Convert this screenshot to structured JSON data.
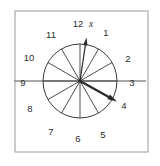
{
  "figure": {
    "frame": {
      "x": 15,
      "y": 11,
      "width": 133,
      "height": 141,
      "stroke": "#9a9a9a"
    },
    "clock": {
      "center_x": 80,
      "center_y": 81,
      "radius": 37,
      "stroke": "#3a3a3a",
      "hub_radius": 1.8
    },
    "hour_labels": [
      {
        "text": "12",
        "x": 78,
        "y": 27,
        "anchor": "middle"
      },
      {
        "text": "1",
        "x": 106,
        "y": 36,
        "anchor": "middle"
      },
      {
        "text": "2",
        "x": 128,
        "y": 62,
        "anchor": "middle"
      },
      {
        "text": "3",
        "x": 132,
        "y": 86,
        "anchor": "middle"
      },
      {
        "text": "4",
        "x": 124,
        "y": 109,
        "anchor": "middle"
      },
      {
        "text": "5",
        "x": 103,
        "y": 138,
        "anchor": "middle"
      },
      {
        "text": "6",
        "x": 78,
        "y": 142,
        "anchor": "middle"
      },
      {
        "text": "7",
        "x": 51,
        "y": 135,
        "anchor": "middle"
      },
      {
        "text": "8",
        "x": 30,
        "y": 112,
        "anchor": "middle"
      },
      {
        "text": "9",
        "x": 23,
        "y": 86,
        "anchor": "middle"
      },
      {
        "text": "10",
        "x": 29,
        "y": 61,
        "anchor": "middle"
      },
      {
        "text": "11",
        "x": 51,
        "y": 38,
        "anchor": "middle"
      }
    ],
    "axis_line": {
      "name": "horizontal-reference-axis",
      "x1": 14,
      "y1": 81,
      "x2": 146,
      "y2": 81,
      "stroke": "#8d8d8d"
    },
    "vectors": [
      {
        "name": "vector-x",
        "label": "x",
        "label_x": 89,
        "label_y": 27,
        "from_x": 80,
        "from_y": 81,
        "to_x": 86.5,
        "to_y": 37.5,
        "stroke": "#2b2b2b",
        "width": 1.2,
        "head": 4.2
      },
      {
        "name": "vector-hour-hand",
        "label": "",
        "from_x": 80,
        "from_y": 81,
        "to_x": 117,
        "to_y": 101.5,
        "stroke": "#2b2b2b",
        "width": 2.1,
        "head": 5.0
      }
    ],
    "spokes_count": 12
  }
}
